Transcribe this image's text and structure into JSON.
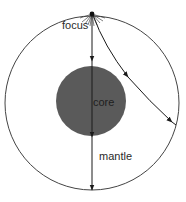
{
  "diagram": {
    "title": "",
    "labels": {
      "focus": "focus",
      "core": "core",
      "mantle": "mantle"
    },
    "colors": {
      "background": "#ffffff",
      "outer_circle_stroke": "#444444",
      "core_fill": "#5a5a5a",
      "ray_stroke": "#222222",
      "label_text": "#2a2a2a"
    },
    "elements": {
      "outer_circle": "Earth outline (mantle boundary)",
      "core_circle": "Earth core, dark filled disk",
      "focus_point": "earthquake focus at top with radiating starburst",
      "rays": [
        {
          "name": "vertical-ray",
          "description": "straight ray through core to antipode",
          "arrowheads": 3
        },
        {
          "name": "curved-ray",
          "description": "curved ray through mantle to right side",
          "arrowheads": 2
        }
      ]
    }
  }
}
